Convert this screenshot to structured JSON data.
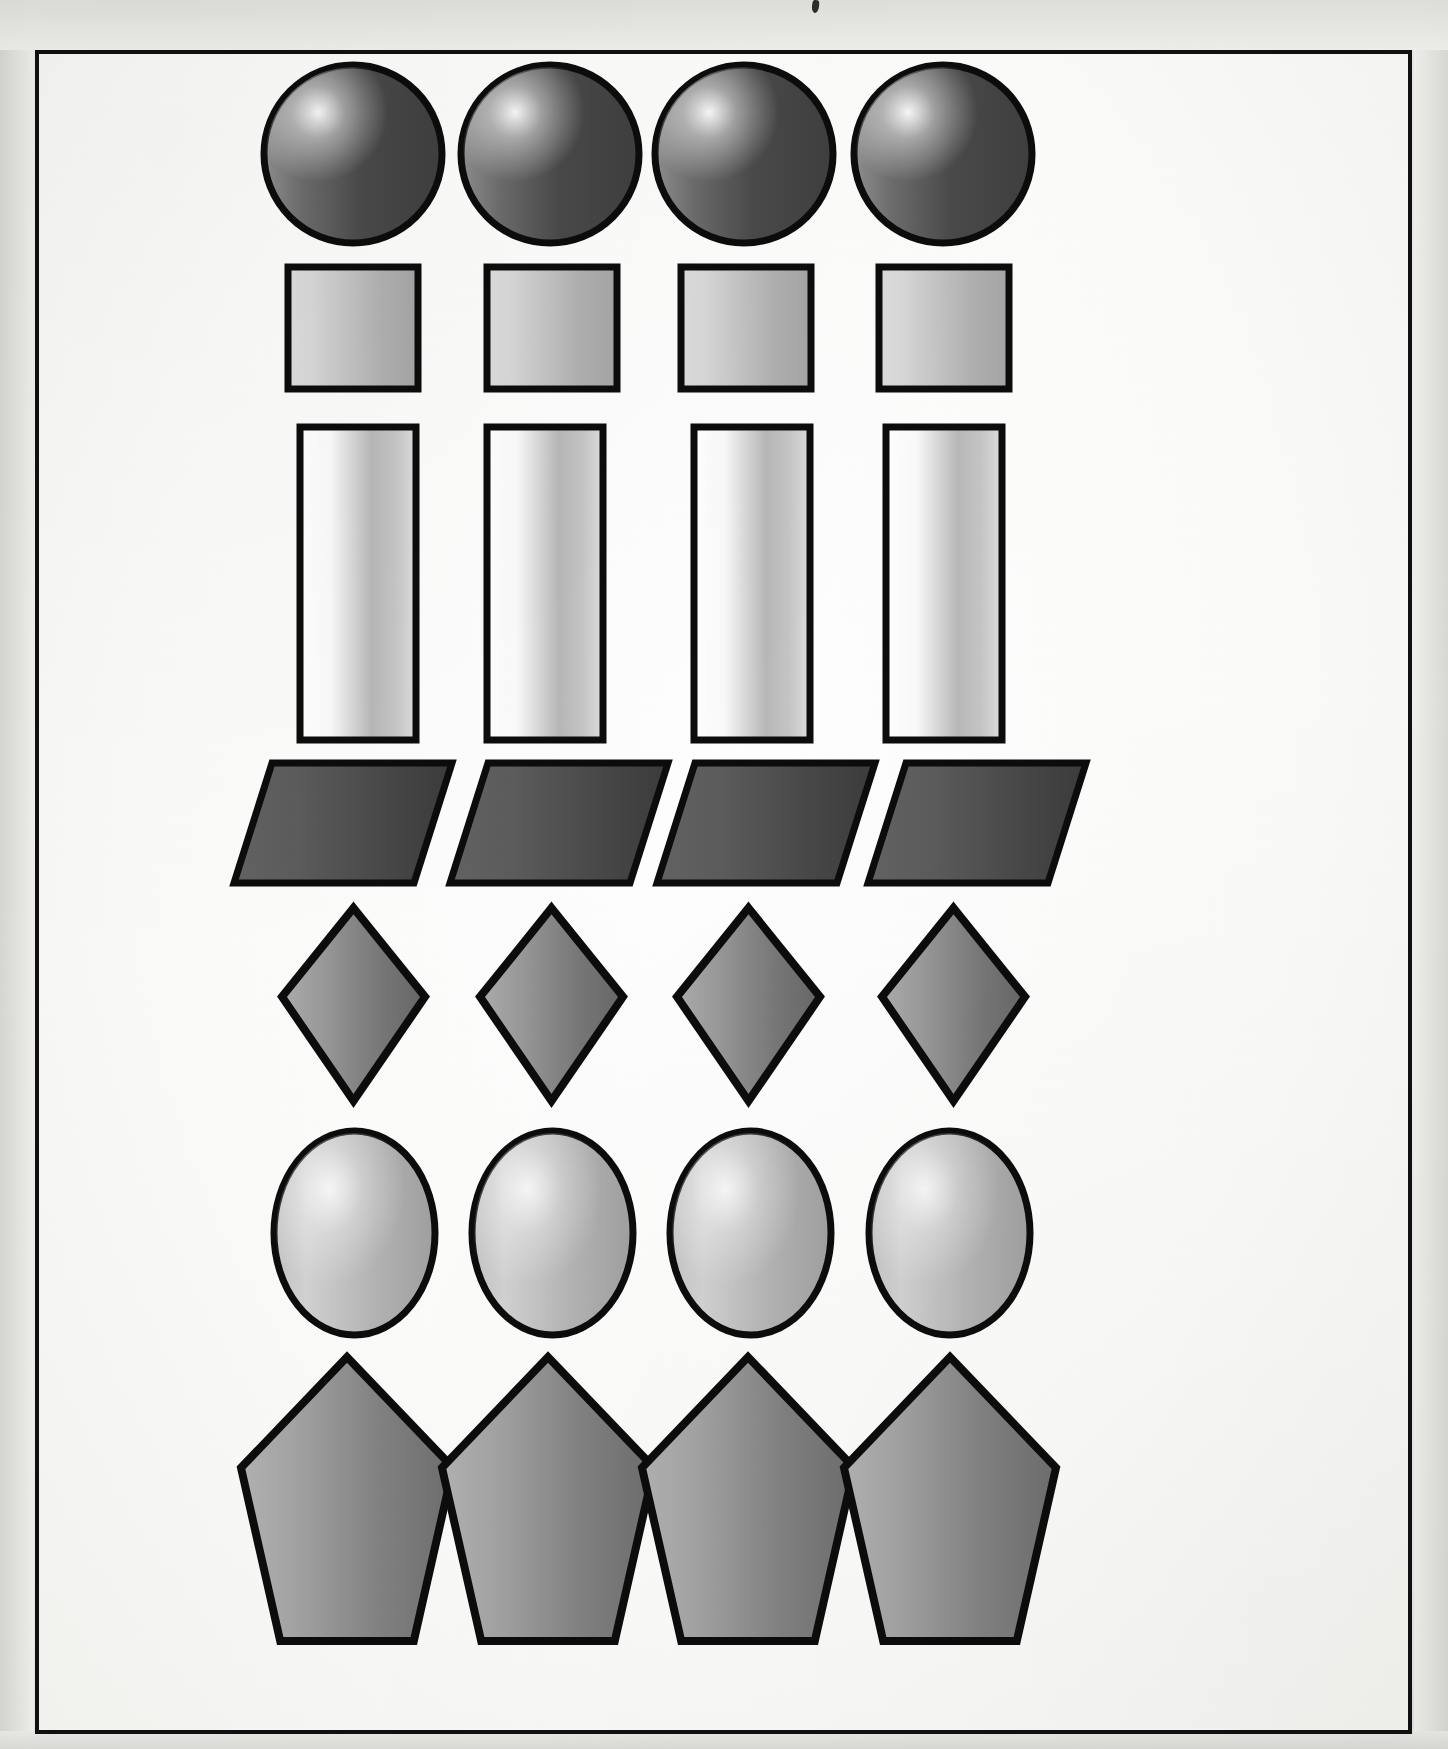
{
  "page": {
    "width": 1448,
    "height": 1749,
    "background_color": "#ececeb",
    "paper_color": "#fafaf8"
  },
  "frame": {
    "name": "page-border",
    "x": 35,
    "y": 50,
    "width": 1377,
    "height": 1684,
    "stroke_color": "#111111",
    "stroke_width": 4
  },
  "artifacts": [
    {
      "name": "scan-speck",
      "x": 812,
      "y": 0,
      "width": 7,
      "height": 13,
      "color": "#1a1a1a"
    }
  ],
  "grid": {
    "columns": 4,
    "rows": 7,
    "column_centers": [
      353,
      550,
      744,
      943
    ],
    "row_names": [
      "circles",
      "squares",
      "rectangles",
      "parallelograms",
      "diamonds",
      "ellipses",
      "pentagons"
    ]
  },
  "rows": [
    {
      "name": "circle-row",
      "shape": "circle",
      "count": 4,
      "y": 65,
      "height": 178,
      "item_width": 178,
      "fill_light": "#8f8f8f",
      "fill_dark": "#4a4a4a",
      "highlight_color": "#ffffff",
      "stroke_color": "#0d0d0d",
      "stroke_width": 7,
      "centers_x": [
        353,
        550,
        744,
        943
      ]
    },
    {
      "name": "square-row",
      "shape": "square",
      "count": 4,
      "y": 267,
      "height": 122,
      "item_width": 130,
      "fill_light": "#d8d8d8",
      "fill_dark": "#a5a5a5",
      "stroke_color": "#0d0d0d",
      "stroke_width": 7,
      "centers_x": [
        353,
        552,
        746,
        944
      ]
    },
    {
      "name": "rectangle-row",
      "shape": "rectangle",
      "count": 4,
      "y": 427,
      "height": 313,
      "item_width": 116,
      "fill_light": "#ffffff",
      "fill_dark": "#b3b3b3",
      "stroke_color": "#0d0d0d",
      "stroke_width": 7,
      "centers_x": [
        358,
        545,
        752,
        944
      ]
    },
    {
      "name": "parallelogram-row",
      "shape": "parallelogram",
      "count": 4,
      "y": 763,
      "height": 120,
      "item_width": 218,
      "skew_offset": 38,
      "fill_light": "#5c5c5c",
      "fill_dark": "#3c3c3c",
      "stroke_color": "#0d0d0d",
      "stroke_width": 7,
      "lefts_x": [
        234,
        450,
        657,
        868
      ]
    },
    {
      "name": "diamond-row",
      "shape": "diamond",
      "count": 4,
      "y": 908,
      "height": 193,
      "item_width": 143,
      "fill_light": "#9a9a9a",
      "fill_dark": "#676767",
      "stroke_color": "#0d0d0d",
      "stroke_width": 8,
      "centers_x": [
        353,
        551,
        748,
        953
      ]
    },
    {
      "name": "ellipse-row",
      "shape": "ellipse",
      "count": 4,
      "y": 1131,
      "height": 204,
      "item_width": 161,
      "fill_light": "#d2d2d2",
      "fill_dark": "#a0a0a0",
      "stroke_color": "#0d0d0d",
      "stroke_width": 7,
      "centers_x": [
        354,
        552,
        750,
        949
      ]
    },
    {
      "name": "pentagon-row",
      "shape": "pentagon",
      "count": 4,
      "y": 1357,
      "height": 284,
      "item_width": 212,
      "fill_light": "#a3a3a3",
      "fill_dark": "#6e6e6e",
      "stroke_color": "#0d0d0d",
      "stroke_width": 8,
      "centers_x": [
        347,
        548,
        748,
        950
      ]
    }
  ]
}
